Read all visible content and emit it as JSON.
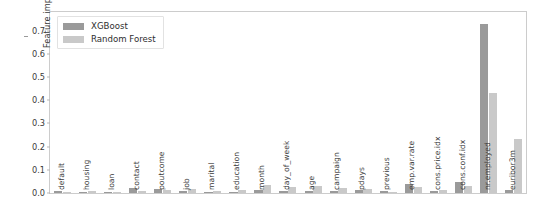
{
  "chart_data": {
    "type": "bar",
    "title": "",
    "xlabel": "",
    "ylabel": "Feature importances",
    "ylim": [
      0.0,
      0.78
    ],
    "yticks": [
      "0.0",
      "0.1",
      "0.2",
      "0.3",
      "0.4",
      "0.5",
      "0.6",
      "0.7"
    ],
    "ytick_values": [
      0.0,
      0.1,
      0.2,
      0.3,
      0.4,
      0.5,
      0.6,
      0.7
    ],
    "grid": false,
    "legend_position": "upper left",
    "categories": [
      "default",
      "housing",
      "loan",
      "contact",
      "poutcome",
      "job",
      "marital",
      "education",
      "month",
      "day_of_week",
      "age",
      "campaign",
      "pdays",
      "previous",
      "emp.var.rate",
      "cons.price.idx",
      "cons.conf.idx",
      "nr.employed",
      "euribor3m"
    ],
    "series": [
      {
        "name": "XGBoost",
        "color": "#9a9a9a",
        "values": [
          0.008,
          0.006,
          0.005,
          0.02,
          0.018,
          0.007,
          0.006,
          0.006,
          0.014,
          0.01,
          0.008,
          0.009,
          0.014,
          0.008,
          0.04,
          0.007,
          0.049,
          0.73,
          0.012
        ]
      },
      {
        "name": "Random Forest",
        "color": "#c9c9c9",
        "values": [
          0.004,
          0.007,
          0.004,
          0.01,
          0.014,
          0.016,
          0.01,
          0.014,
          0.033,
          0.024,
          0.03,
          0.023,
          0.017,
          0.006,
          0.028,
          0.015,
          0.029,
          0.43,
          0.232
        ]
      }
    ]
  },
  "legend": {
    "items": [
      {
        "label": "XGBoost",
        "swatch": "#9a9a9a"
      },
      {
        "label": "Random Forest",
        "swatch": "#c9c9c9"
      }
    ]
  },
  "axes": {
    "y_label": "Feature importances"
  }
}
